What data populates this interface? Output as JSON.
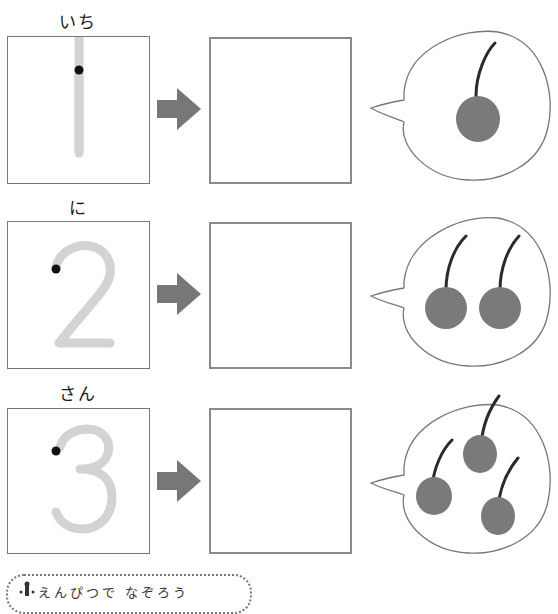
{
  "rows": [
    {
      "label": "いち",
      "number": "1",
      "count": 1
    },
    {
      "label": "に",
      "number": "2",
      "count": 2
    },
    {
      "label": "さん",
      "number": "3",
      "count": 3
    }
  ],
  "footer": {
    "text": "えんぴつで なぞろう"
  },
  "colors": {
    "trace_stroke": "#d3d3d3",
    "start_dot": "#111111",
    "arrow": "#777777",
    "cherry": "#7a7a7a",
    "stem": "#2a2a2a",
    "box_border": "#8a8a8a"
  }
}
